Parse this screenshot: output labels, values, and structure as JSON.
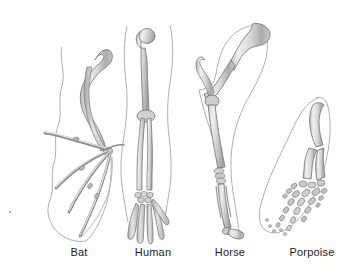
{
  "figure": {
    "background_color": "#ffffff",
    "label_color": "#1d1d1d",
    "bone_fill_light": "#ececec",
    "bone_fill_mid": "#cfcfcf",
    "bone_fill_dark": "#a8a8a8",
    "bone_outline": "#6e6e6e",
    "body_outline": "#9b9b9b"
  },
  "specimens": [
    {
      "id": "bat",
      "label": "Bat",
      "label_x": 79,
      "limb_type": "wing",
      "description": "Elongated digits spread to support wing membrane"
    },
    {
      "id": "human",
      "label": "Human",
      "label_x": 153,
      "limb_type": "arm",
      "description": "Humerus, radius and ulna, carpals and five digits"
    },
    {
      "id": "horse",
      "label": "Horse",
      "label_x": 230,
      "limb_type": "foreleg",
      "description": "Reduced to a single weight-bearing digit"
    },
    {
      "id": "porpoise",
      "label": "Porpoise",
      "label_x": 312,
      "limb_type": "flipper",
      "description": "Short limb bones with many shortened phalanges"
    }
  ]
}
